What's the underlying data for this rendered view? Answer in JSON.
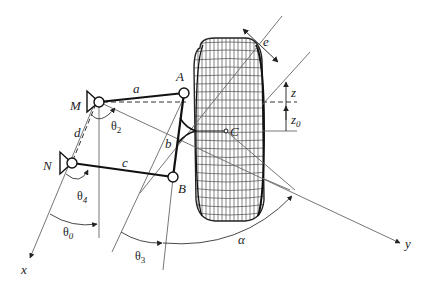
{
  "diagram": {
    "type": "four-bar steering/suspension linkage with wheel",
    "points": {
      "M": "M",
      "A": "A",
      "N": "N",
      "B": "B",
      "C": "C"
    },
    "links": {
      "a": "a",
      "b": "b",
      "c": "c",
      "d": "d"
    },
    "angles": {
      "theta0": "θ",
      "theta0_sub": "0",
      "theta2": "θ",
      "theta2_sub": "2",
      "theta3": "θ",
      "theta3_sub": "3",
      "theta4": "θ",
      "theta4_sub": "4",
      "alpha": "α"
    },
    "dimensions": {
      "e": "e",
      "z": "z",
      "z0": "z",
      "z0_sub": "0"
    },
    "axes": {
      "x": "x",
      "y": "y"
    }
  }
}
